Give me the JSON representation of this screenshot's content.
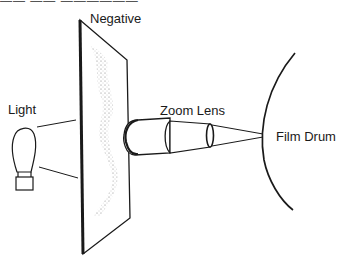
{
  "diagram": {
    "labels": {
      "negative": "Negative",
      "light": "Light",
      "zoom_lens": "Zoom Lens",
      "film_drum": "Film Drum"
    },
    "top_fragment": "—— —— ——————",
    "colors": {
      "line": "#1a1a1a",
      "stipple": "#8a8a8a",
      "background": "#ffffff"
    }
  }
}
